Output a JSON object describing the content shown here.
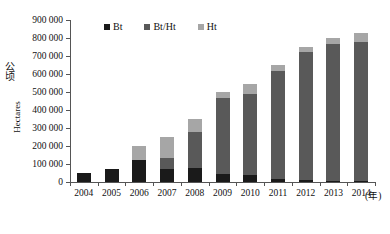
{
  "chart_data": {
    "type": "bar",
    "subtype": "stacked-bar",
    "title": "",
    "xlabel": "(年)",
    "ylabel": "公顷 / Hectares",
    "ylabel_cn": "公顷",
    "ylabel_en": "Hectares",
    "xaxis_unit": "(年)",
    "categories": [
      "2004",
      "2005",
      "2006",
      "2007",
      "2008",
      "2009",
      "2010",
      "2011",
      "2012",
      "2013",
      "2014"
    ],
    "ylim": [
      0,
      900000
    ],
    "ytick_values": [
      0,
      100000,
      200000,
      300000,
      400000,
      500000,
      600000,
      700000,
      800000,
      900000
    ],
    "ytick_labels": [
      "0",
      "100 000",
      "200 000",
      "300 000",
      "400 000",
      "500 000",
      "600 000",
      "700 000",
      "800 000",
      "900 000"
    ],
    "grid": false,
    "legend_position": "top-center",
    "series": [
      {
        "name": "Bt",
        "color": "#1a1a1a",
        "values": [
          50000,
          70000,
          125000,
          75000,
          80000,
          45000,
          40000,
          15000,
          10000,
          8000,
          6000
        ]
      },
      {
        "name": "Bt/Ht",
        "color": "#595959",
        "values": [
          0,
          0,
          0,
          60000,
          200000,
          420000,
          450000,
          600000,
          710000,
          760000,
          770000
        ]
      },
      {
        "name": "Ht",
        "color": "#a6a6a6",
        "values": [
          0,
          0,
          75000,
          115000,
          70000,
          35000,
          55000,
          35000,
          30000,
          32000,
          54000
        ]
      }
    ],
    "totals": [
      50000,
      70000,
      200000,
      250000,
      350000,
      500000,
      545000,
      650000,
      750000,
      800000,
      830000
    ]
  },
  "legend": {
    "items": [
      {
        "label": "Bt",
        "color": "#1a1a1a"
      },
      {
        "label": "Bt/Ht",
        "color": "#595959"
      },
      {
        "label": "Ht",
        "color": "#a6a6a6"
      }
    ]
  }
}
